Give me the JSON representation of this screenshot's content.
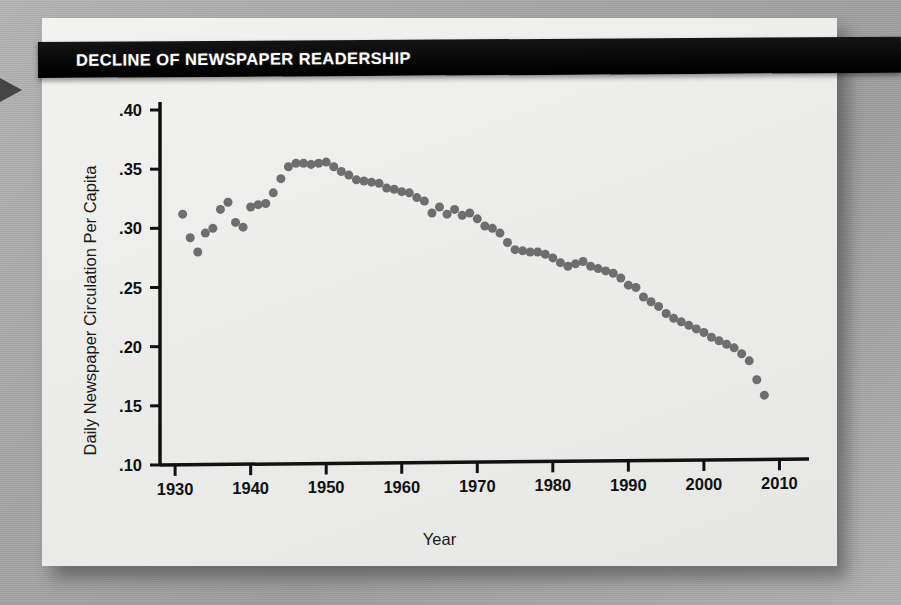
{
  "banner": {
    "title": "DECLINE OF NEWSPAPER READERSHIP"
  },
  "colors": {
    "banner_bg": "#000000",
    "banner_text": "#ffffff",
    "card_bg": "#efefed",
    "page_bg": "#a9a9a9",
    "marker": "#6e6e6e",
    "axis": "#111111"
  },
  "icons": {
    "edge_marker": "triangle-right-icon"
  },
  "chart_data": {
    "type": "scatter",
    "title": "DECLINE OF NEWSPAPER READERSHIP",
    "xlabel": "Year",
    "ylabel": "Daily Newspaper Circulation Per Capita",
    "xlim": [
      1928,
      2011
    ],
    "ylim": [
      0.1,
      0.4
    ],
    "grid": false,
    "legend": null,
    "xticks": [
      1930,
      1940,
      1950,
      1960,
      1970,
      1980,
      1990,
      2000,
      2010
    ],
    "xtick_labels": [
      "1930",
      "1940",
      "1950",
      "1960",
      "1970",
      "1980",
      "1990",
      "2000",
      "2010"
    ],
    "yticks": [
      0.1,
      0.15,
      0.2,
      0.25,
      0.3,
      0.35,
      0.4
    ],
    "ytick_labels": [
      ".10",
      ".15",
      ".20",
      ".25",
      ".30",
      ".35",
      ".40"
    ],
    "marker_color": "#6e6e6e",
    "marker_size": 9,
    "x": [
      1931,
      1932,
      1933,
      1934,
      1935,
      1936,
      1937,
      1938,
      1939,
      1940,
      1941,
      1942,
      1943,
      1944,
      1945,
      1946,
      1947,
      1948,
      1949,
      1950,
      1951,
      1952,
      1953,
      1954,
      1955,
      1956,
      1957,
      1958,
      1959,
      1960,
      1961,
      1962,
      1963,
      1964,
      1965,
      1966,
      1967,
      1968,
      1969,
      1970,
      1971,
      1972,
      1973,
      1974,
      1975,
      1976,
      1977,
      1978,
      1979,
      1980,
      1981,
      1982,
      1983,
      1984,
      1985,
      1986,
      1987,
      1988,
      1989,
      1990,
      1991,
      1992,
      1993,
      1994,
      1995,
      1996,
      1997,
      1998,
      1999,
      2000,
      2001,
      2002,
      2003,
      2004,
      2005,
      2006,
      2007,
      2008
    ],
    "y": [
      0.312,
      0.292,
      0.28,
      0.296,
      0.3,
      0.316,
      0.322,
      0.305,
      0.301,
      0.318,
      0.32,
      0.321,
      0.33,
      0.342,
      0.352,
      0.355,
      0.355,
      0.354,
      0.355,
      0.356,
      0.352,
      0.348,
      0.345,
      0.341,
      0.34,
      0.339,
      0.338,
      0.334,
      0.333,
      0.331,
      0.33,
      0.326,
      0.323,
      0.313,
      0.318,
      0.312,
      0.316,
      0.311,
      0.313,
      0.308,
      0.302,
      0.3,
      0.296,
      0.288,
      0.282,
      0.281,
      0.28,
      0.28,
      0.278,
      0.275,
      0.271,
      0.268,
      0.27,
      0.272,
      0.268,
      0.266,
      0.264,
      0.262,
      0.258,
      0.252,
      0.25,
      0.242,
      0.238,
      0.234,
      0.228,
      0.224,
      0.221,
      0.218,
      0.215,
      0.212,
      0.208,
      0.205,
      0.202,
      0.199,
      0.194,
      0.188,
      0.172,
      0.159
    ]
  }
}
